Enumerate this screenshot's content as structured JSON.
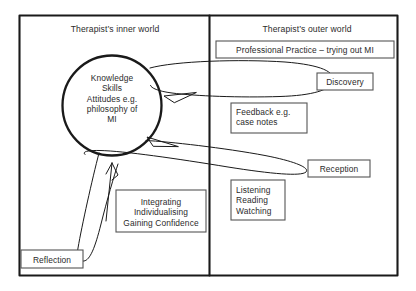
{
  "diagram": {
    "type": "flow-diagram",
    "panels": [
      {
        "id": "inner",
        "header": "Therapist’s inner world"
      },
      {
        "id": "outer",
        "header": "Therapist’s outer world"
      }
    ],
    "circle": {
      "name": "knowledge-circle",
      "lines": [
        "Knowledge",
        "Skills",
        "Attitudes e.g.",
        "philosophy of",
        "MI"
      ]
    },
    "boxes": [
      {
        "id": "professional-practice",
        "text": "Professional Practice – trying out MI",
        "align": "center"
      },
      {
        "id": "discovery",
        "text": "Discovery",
        "align": "center"
      },
      {
        "id": "feedback",
        "lines": [
          "Feedback e.g.",
          "case notes"
        ],
        "align": "left"
      },
      {
        "id": "reception",
        "text": "Reception",
        "align": "center"
      },
      {
        "id": "listening",
        "lines": [
          "Listening",
          "Reading",
          "Watching"
        ],
        "align": "left"
      },
      {
        "id": "integrating",
        "lines": [
          "Integrating",
          "Individualising",
          "Gaining Confidence"
        ],
        "align": "center"
      },
      {
        "id": "reflection",
        "text": "Reflection",
        "align": "center"
      }
    ],
    "loops": [
      {
        "id": "discovery-loop",
        "label": "upper ellipse from circle to Discovery"
      },
      {
        "id": "reception-loop",
        "label": "lower tilted ellipse from circle to Reception"
      },
      {
        "id": "reflection-loop",
        "label": "vertical loop from circle to Reflection"
      }
    ],
    "colors": {
      "stroke": "#1a1a1a",
      "text": "#2b2b2b",
      "background": "#ffffff"
    }
  }
}
